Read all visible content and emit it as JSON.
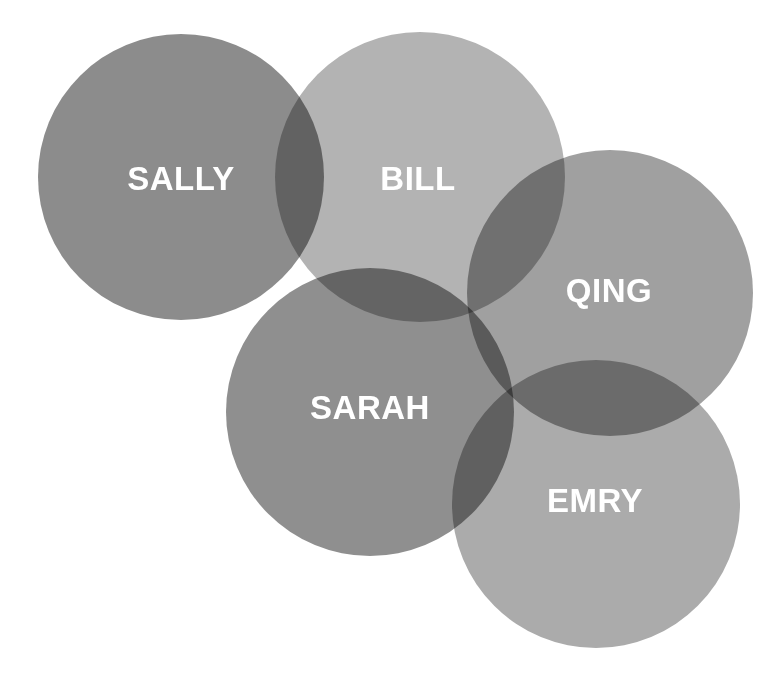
{
  "figure": {
    "type": "venn-diagram",
    "background_color": "#ffffff",
    "width": 774,
    "height": 684,
    "label_color": "#ffffff",
    "label_font_size": 33
  },
  "chart_data": {
    "type": "venn",
    "title": "",
    "xlabel": "",
    "ylabel": "",
    "legend": [],
    "sets": [
      {
        "label": "SALLY",
        "cx": 181,
        "cy": 177,
        "r": 143,
        "fill": "#8c8c8c",
        "opacity": 1,
        "z": 1,
        "label_x": 181,
        "label_y": 181
      },
      {
        "label": "BILL",
        "cx": 420,
        "cy": 177,
        "r": 145,
        "fill": "#b3b3b3",
        "opacity": 1,
        "z": 2,
        "label_x": 418,
        "label_y": 181
      },
      {
        "label": "QING",
        "cx": 610,
        "cy": 293,
        "r": 143,
        "fill": "#a0a0a0",
        "opacity": 1,
        "z": 3,
        "label_x": 609,
        "label_y": 293
      },
      {
        "label": "SARAH",
        "cx": 370,
        "cy": 412,
        "r": 144,
        "fill": "#8f8f8f",
        "opacity": 1,
        "z": 4,
        "label_x": 370,
        "label_y": 410
      },
      {
        "label": "EMRY",
        "cx": 596,
        "cy": 504,
        "r": 144,
        "fill": "#ababab",
        "opacity": 1,
        "z": 5,
        "label_x": 595,
        "label_y": 503
      }
    ]
  }
}
